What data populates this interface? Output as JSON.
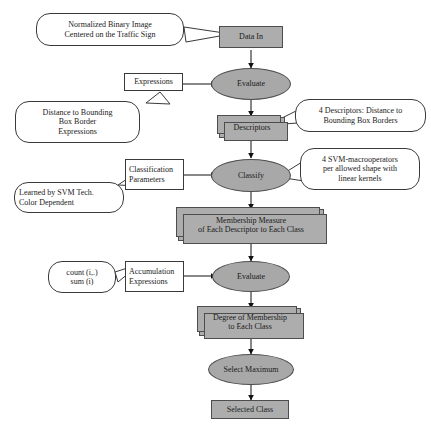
{
  "diagram": {
    "colors": {
      "node_fill": "#adadad",
      "ellipse_fill": "#a8a8a8",
      "stroke": "#4d4d4d",
      "callout_fill": "#ffffff",
      "background": "#ffffff"
    }
  },
  "nodes": {
    "data_in": {
      "label": "Data In"
    },
    "evaluate_1": {
      "label": "Evaluate"
    },
    "descriptors": {
      "label": "Descriptors"
    },
    "classify": {
      "label": "Classify"
    },
    "membership_measure": {
      "line1": "Membership Measure",
      "line2": "of Each Descriptor to Each Class"
    },
    "evaluate_2": {
      "label": "Evaluate"
    },
    "degree_of_membership": {
      "line1": "Degree of Membership",
      "line2": "to Each Class"
    },
    "select_maximum": {
      "label": "Select Maximum"
    },
    "selected_class": {
      "label": "Selected Class"
    }
  },
  "params": {
    "expressions": {
      "label": "Expressions"
    },
    "classification_parameters": {
      "line1": "Classification",
      "line2": "Parameters"
    },
    "accumulation_expressions": {
      "line1": "Accumulation",
      "line2": "Expressions"
    }
  },
  "callouts": {
    "input_note": {
      "line1": "Normalized Binary Image",
      "line2": "Centered on the Traffic Sign"
    },
    "expressions_note": {
      "line1": "Distance to Bounding",
      "line2": "Box Border",
      "line3": "Expressions"
    },
    "descriptors_note": {
      "line1": "4 Descriptors:  Distance to",
      "line2": "Bounding Box Borders"
    },
    "classification_params_note": {
      "line1": "Learned by SVM Tech.",
      "line2": "Color Dependent"
    },
    "classify_note": {
      "line1": "4 SVM-macrooperators",
      "line2": "per allowed shape with",
      "line3": "linear kernels"
    },
    "accumulation_note": {
      "line1": "count (i,.)",
      "line2": "sum (i)"
    }
  }
}
